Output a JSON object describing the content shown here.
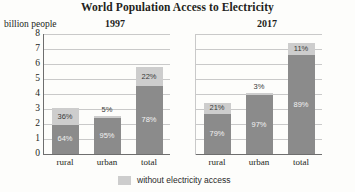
{
  "chart_data": {
    "type": "bar",
    "title": "World Population Access to Electricity",
    "subtype": "stacked-percentage-bar",
    "ylabel": "billion people",
    "xlabel": "",
    "ylim": [
      0,
      8
    ],
    "yticks": [
      8,
      7,
      6,
      5,
      4,
      3,
      2,
      1,
      0
    ],
    "grid": true,
    "legend_position": "bottom-center",
    "legend": [
      {
        "label": "without electricity access",
        "color": "#cdcdcd"
      }
    ],
    "series": [
      {
        "name": "with electricity access",
        "color": "#8b8b8b"
      },
      {
        "name": "without electricity access",
        "color": "#cdcdcd"
      }
    ],
    "panels": [
      {
        "title": "1997",
        "categories": [
          "rural",
          "urban",
          "total"
        ],
        "bars": [
          {
            "category": "rural",
            "total": 3.05,
            "with_pct": "64%",
            "without_pct": "36%",
            "with_value": 1.95,
            "without_value": 1.1,
            "without_label_inside": true
          },
          {
            "category": "urban",
            "total": 2.55,
            "with_pct": "95%",
            "without_pct": "5%",
            "with_value": 2.42,
            "without_value": 0.13,
            "without_label_inside": false
          },
          {
            "category": "total",
            "total": 5.8,
            "with_pct": "78%",
            "without_pct": "22%",
            "with_value": 4.52,
            "without_value": 1.28,
            "without_label_inside": true
          }
        ]
      },
      {
        "title": "2017",
        "categories": [
          "rural",
          "urban",
          "total"
        ],
        "bars": [
          {
            "category": "rural",
            "total": 3.4,
            "with_pct": "79%",
            "without_pct": "21%",
            "with_value": 2.69,
            "without_value": 0.71,
            "without_label_inside": true
          },
          {
            "category": "urban",
            "total": 4.05,
            "with_pct": "97%",
            "without_pct": "3%",
            "with_value": 3.93,
            "without_value": 0.12,
            "without_label_inside": false
          },
          {
            "category": "total",
            "total": 7.4,
            "with_pct": "89%",
            "without_pct": "11%",
            "with_value": 6.59,
            "without_value": 0.81,
            "without_label_inside": true
          }
        ]
      }
    ]
  }
}
